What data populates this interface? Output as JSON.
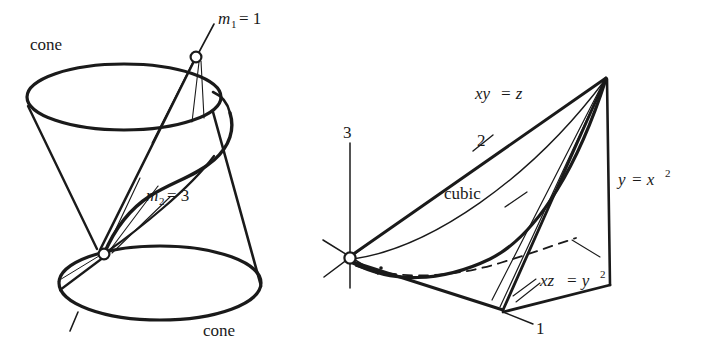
{
  "figure": {
    "background_color": "#ffffff",
    "ink_color": "#1a1a1a",
    "width": 705,
    "height": 356
  },
  "left_panel": {
    "name": "double-cone-with-intersection-curve",
    "labels": {
      "cone_top": "cone",
      "cone_bottom": "cone",
      "m1_var": "m",
      "m1_sub": "1",
      "m1_eq": "= 1",
      "m2_var": "m",
      "m2_sub": "2",
      "m2_eq": "= 3",
      "m1_full": "m1 = 1",
      "m2_full": "m2 = 3"
    },
    "nodes": [
      {
        "name": "upper-vertex-node",
        "x": 196,
        "y": 57
      },
      {
        "name": "lower-vertex-node",
        "x": 104,
        "y": 254
      }
    ],
    "multiplicities": [
      {
        "point": "m1",
        "value": 1
      },
      {
        "point": "m2",
        "value": 3
      }
    ]
  },
  "right_panel": {
    "name": "twisted-cubic-surfaces-diagram",
    "labels": {
      "axis_3": "3",
      "axis_2": "2",
      "axis_1": "1",
      "cubic": "cubic",
      "xy_z_var1": "xy",
      "xy_z_eq": "= z",
      "xy_z_full": "xy = z",
      "y_x2_var": "y",
      "y_x2_eq": "= x",
      "y_x2_sup": "2",
      "y_x2_full": "y = x2",
      "xz_y2_var": "xz",
      "xz_y2_eq": "= y",
      "xz_y2_sup": "2",
      "xz_y2_full": "xz = y2"
    },
    "nodes": [
      {
        "name": "origin-node",
        "x": 350,
        "y": 258
      }
    ],
    "surfaces": [
      "xy = z",
      "y = x^2",
      "xz = y^2"
    ],
    "curve": "cubic"
  }
}
